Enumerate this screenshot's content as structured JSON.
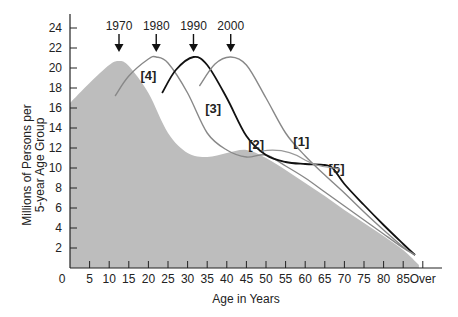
{
  "chart_data": {
    "type": "area",
    "title": "",
    "xlabel": "Age in Years",
    "ylabel_lines": [
      "Millions of Persons per",
      "5-year Age Group"
    ],
    "ylabel": "Millions of Persons per 5-year Age Group",
    "x_ticks": [
      "5",
      "10",
      "15",
      "20",
      "25",
      "30",
      "35",
      "40",
      "45",
      "50",
      "55",
      "60",
      "65",
      "70",
      "75",
      "80",
      "85",
      "Over"
    ],
    "y_ticks": [
      "2",
      "4",
      "6",
      "8",
      "10",
      "12",
      "14",
      "16",
      "18",
      "20",
      "22",
      "24"
    ],
    "y_origin_label": "0",
    "xlim": [
      0,
      90
    ],
    "ylim": [
      0,
      25
    ],
    "grid": false,
    "legend": "none",
    "year_markers": [
      {
        "label": "1970",
        "age": 12.5
      },
      {
        "label": "1980",
        "age": 22
      },
      {
        "label": "1990",
        "age": 31.5
      },
      {
        "label": "2000",
        "age": 41
      }
    ],
    "series": [
      {
        "name": "1970",
        "style": "filled-area",
        "color": "#bdbdbd",
        "x": [
          0,
          5,
          10,
          12.5,
          15,
          20,
          25,
          30,
          35,
          40,
          45,
          50,
          55,
          60,
          65,
          70,
          75,
          80,
          85,
          89
        ],
        "values": [
          16.5,
          18.5,
          20.3,
          20.7,
          20.2,
          17.5,
          13.5,
          11.5,
          11.1,
          11.5,
          11.8,
          11.0,
          9.8,
          8.5,
          7.2,
          5.8,
          4.5,
          3.2,
          1.8,
          0.3
        ]
      },
      {
        "name": "1980",
        "style": "line",
        "color": "#888888",
        "x": [
          11.5,
          15,
          20,
          22,
          25,
          30,
          35,
          40,
          45,
          50,
          55,
          60,
          65,
          70,
          75,
          80,
          85,
          88
        ],
        "values": [
          17.2,
          19.2,
          20.9,
          21.1,
          20.5,
          17.5,
          13.5,
          11.8,
          11.1,
          11.3,
          10.2,
          9.0,
          7.6,
          6.2,
          4.8,
          3.4,
          2.0,
          1.3
        ]
      },
      {
        "name": "1990",
        "style": "line",
        "color": "#111111",
        "x": [
          23.5,
          27,
          31.5,
          35,
          40,
          45,
          50,
          55,
          60,
          65,
          67,
          70,
          75,
          80,
          85,
          88
        ],
        "values": [
          17.5,
          19.8,
          21.1,
          20.3,
          17.0,
          13.2,
          11.3,
          10.6,
          10.4,
          10.3,
          10.0,
          8.4,
          6.3,
          4.3,
          2.4,
          1.3
        ]
      },
      {
        "name": "2000",
        "style": "line",
        "color": "#888888",
        "x": [
          33,
          37,
          41,
          45,
          50,
          55,
          60,
          65,
          70,
          75,
          80,
          85,
          88
        ],
        "values": [
          18.2,
          20.4,
          21.1,
          20.3,
          17.0,
          13.5,
          11.2,
          9.3,
          7.5,
          5.6,
          3.8,
          2.1,
          1.3
        ]
      }
    ],
    "annotations": [
      {
        "label": "[1]",
        "age": 59,
        "value": 12.2
      },
      {
        "label": "[2]",
        "age": 47.5,
        "value": 11.9
      },
      {
        "label": "[3]",
        "age": 36.5,
        "value": 15.5
      },
      {
        "label": "[4]",
        "age": 20,
        "value": 18.8
      },
      {
        "label": "[5]",
        "age": 68,
        "value": 9.5
      }
    ]
  },
  "labels": {
    "x_axis_title": "Age in Years",
    "y_axis_title_line1": "Millions of Persons per",
    "y_axis_title_line2": "5-year Age Group",
    "origin": "0"
  }
}
